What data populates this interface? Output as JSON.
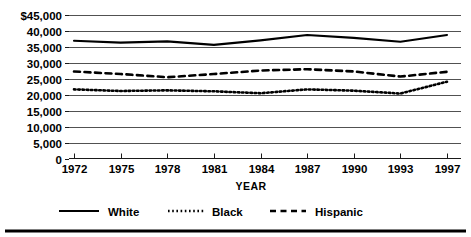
{
  "chart_data": {
    "type": "line",
    "title": "",
    "subtitle": "",
    "xlabel": "YEAR",
    "ylabel": "",
    "grid": true,
    "legend_position": "bottom",
    "x": [
      1972,
      1975,
      1978,
      1981,
      1984,
      1987,
      1990,
      1993,
      1997
    ],
    "categories": [
      "1972",
      "1975",
      "1978",
      "1981",
      "1984",
      "1987",
      "1990",
      "1993",
      "1997"
    ],
    "xlim": [
      1972,
      1997
    ],
    "ylim": [
      0,
      45000
    ],
    "ytick_values": [
      0,
      5000,
      10000,
      15000,
      20000,
      25000,
      30000,
      35000,
      40000,
      45000
    ],
    "ytick_labels": [
      "0",
      "5,000",
      "10,000",
      "15,000",
      "20,000",
      "25,000",
      "30,000",
      "35,000",
      "40,000",
      "$45,000"
    ],
    "series": [
      {
        "name": "White",
        "style": "solid",
        "color": "#000000",
        "values": [
          36800,
          36200,
          36600,
          35500,
          36900,
          38600,
          37700,
          36500,
          38600
        ]
      },
      {
        "name": "Black",
        "style": "dotted",
        "color": "#000000",
        "values": [
          21600,
          21100,
          21300,
          21000,
          20400,
          21600,
          21200,
          20300,
          24000
        ]
      },
      {
        "name": "Hispanic",
        "style": "dashed",
        "color": "#000000",
        "values": [
          27200,
          26400,
          25400,
          26400,
          27500,
          27900,
          27200,
          25600,
          27100
        ]
      }
    ]
  },
  "legend": {
    "items": [
      {
        "label": "White",
        "style": "solid"
      },
      {
        "label": "Black",
        "style": "dotted"
      },
      {
        "label": "Hispanic",
        "style": "dashed"
      }
    ]
  },
  "axis": {
    "x_title": "YEAR"
  },
  "ticks": {
    "y": [
      {
        "label": "$45,000",
        "value": 45000
      },
      {
        "label": "40,000",
        "value": 40000
      },
      {
        "label": "35,000",
        "value": 35000
      },
      {
        "label": "30,000",
        "value": 30000
      },
      {
        "label": "25,000",
        "value": 25000
      },
      {
        "label": "20,000",
        "value": 20000
      },
      {
        "label": "15,000",
        "value": 15000
      },
      {
        "label": "10,000",
        "value": 10000
      },
      {
        "label": "5,000",
        "value": 5000
      },
      {
        "label": "0",
        "value": 0
      }
    ],
    "x": [
      {
        "label": "1972",
        "value": 1972
      },
      {
        "label": "1975",
        "value": 1975
      },
      {
        "label": "1978",
        "value": 1978
      },
      {
        "label": "1981",
        "value": 1981
      },
      {
        "label": "1984",
        "value": 1984
      },
      {
        "label": "1987",
        "value": 1987
      },
      {
        "label": "1990",
        "value": 1990
      },
      {
        "label": "1993",
        "value": 1993
      },
      {
        "label": "1997",
        "value": 1997
      }
    ]
  }
}
